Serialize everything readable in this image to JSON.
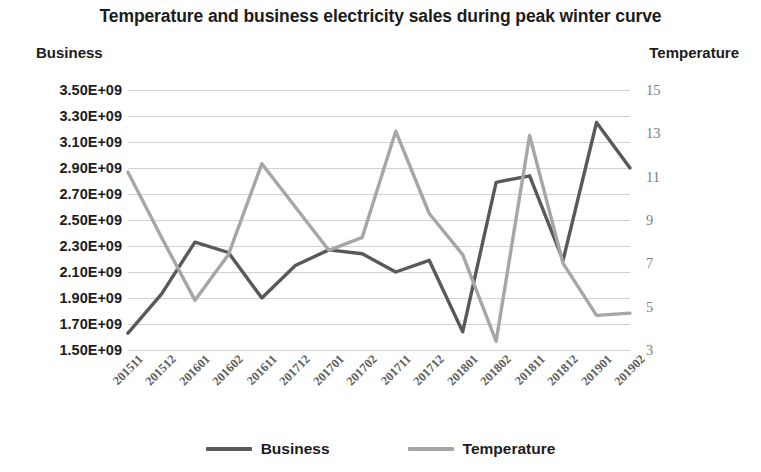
{
  "chart_data": {
    "type": "line",
    "title": "Temperature and business electricity sales during peak winter curve",
    "xlabel": "",
    "ylabel": "Business",
    "y2label": "Temperature",
    "grid": true,
    "legend_position": "bottom",
    "categories": [
      "201511",
      "201512",
      "201601",
      "201602",
      "201611",
      "201712",
      "201701",
      "201702",
      "201711",
      "201712",
      "201801",
      "201802",
      "201811",
      "201812",
      "201901",
      "201902"
    ],
    "ylim": [
      1500000000,
      3500000000
    ],
    "yticks": [
      "1.50E+09",
      "1.70E+09",
      "1.90E+09",
      "2.10E+09",
      "2.30E+09",
      "2.50E+09",
      "2.70E+09",
      "2.90E+09",
      "3.10E+09",
      "3.30E+09",
      "3.50E+09"
    ],
    "y2lim": [
      3,
      15
    ],
    "y2ticks": [
      "3",
      "5",
      "7",
      "9",
      "11",
      "13",
      "15"
    ],
    "series": [
      {
        "name": "Business",
        "axis": "left",
        "color": "#595959",
        "values": [
          1630000000,
          1930000000,
          2330000000,
          2250000000,
          1900000000,
          2150000000,
          2270000000,
          2240000000,
          2100000000,
          2190000000,
          1640000000,
          2790000000,
          2840000000,
          2190000000,
          3250000000,
          2900000000
        ]
      },
      {
        "name": "Temperature",
        "axis": "right",
        "color": "#a6a6a6",
        "values": [
          11.2,
          8.2,
          5.3,
          7.4,
          11.6,
          9.6,
          7.6,
          8.2,
          13.1,
          9.3,
          7.4,
          3.4,
          12.9,
          7.0,
          4.6,
          4.7
        ]
      }
    ]
  },
  "legend": {
    "items": [
      {
        "label": "Business",
        "color": "#595959"
      },
      {
        "label": "Temperature",
        "color": "#a6a6a6"
      }
    ]
  }
}
